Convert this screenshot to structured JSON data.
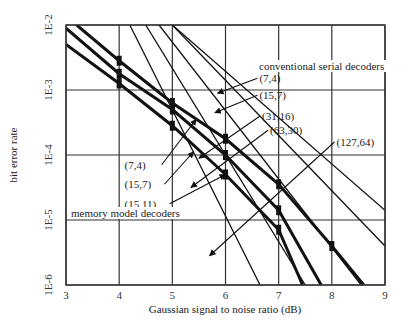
{
  "chart_data": {
    "type": "line",
    "title": "",
    "xlabel": "Gaussian signal to noise ratio (dB)",
    "ylabel": "bit error rate",
    "xlim": [
      3,
      9
    ],
    "ylim_log10": [
      -6,
      -2
    ],
    "y_scale": "log",
    "grid": true,
    "x_ticks": [
      "3",
      "4",
      "5",
      "6",
      "7",
      "8",
      "9"
    ],
    "y_ticks": [
      "1E-2",
      "1E-3",
      "1E-4",
      "1E-5",
      "1E-6"
    ],
    "group_labels": {
      "conventional": "conventional serial decoders",
      "memory": "memory model decoders"
    },
    "series": [
      {
        "name": "(7,4) conventional",
        "group": "conventional",
        "style": "thin",
        "points": [
          [
            4.2,
            -2.0
          ],
          [
            6.65,
            -6.0
          ]
        ]
      },
      {
        "name": "(15,7) conventional",
        "group": "conventional",
        "style": "thin",
        "points": [
          [
            4.5,
            -2.0
          ],
          [
            7.5,
            -6.0
          ]
        ]
      },
      {
        "name": "(31,16) conventional",
        "group": "conventional",
        "style": "thin",
        "points": [
          [
            4.75,
            -2.0
          ],
          [
            8.55,
            -6.0
          ]
        ]
      },
      {
        "name": "(63,30) conventional",
        "group": "conventional",
        "style": "thin",
        "points": [
          [
            5.0,
            -2.0
          ],
          [
            9.0,
            -5.4
          ]
        ]
      },
      {
        "name": "(127,64) conventional",
        "group": "conventional",
        "style": "thin",
        "points": [
          [
            5.0,
            -2.0
          ],
          [
            9.0,
            -4.85
          ]
        ]
      },
      {
        "name": "(7,4) memory",
        "group": "memory",
        "style": "thick",
        "points": [
          [
            3.0,
            -2.3
          ],
          [
            4.0,
            -2.9
          ],
          [
            5.0,
            -3.55
          ],
          [
            6.0,
            -4.3
          ],
          [
            7.0,
            -5.15
          ],
          [
            7.45,
            -6.0
          ]
        ]
      },
      {
        "name": "(15,7) memory",
        "group": "memory",
        "style": "thick",
        "points": [
          [
            3.0,
            -2.05
          ],
          [
            4.0,
            -2.75
          ],
          [
            5.0,
            -3.3
          ],
          [
            6.0,
            -4.0
          ],
          [
            7.0,
            -4.85
          ],
          [
            7.8,
            -6.0
          ]
        ]
      },
      {
        "name": "(15,11) memory",
        "group": "memory",
        "style": "thick",
        "points": [
          [
            3.2,
            -2.0
          ],
          [
            4.0,
            -2.55
          ],
          [
            5.0,
            -3.2
          ],
          [
            6.0,
            -3.75
          ],
          [
            7.0,
            -4.45
          ],
          [
            8.0,
            -5.4
          ],
          [
            8.6,
            -6.0
          ]
        ]
      }
    ],
    "annotations": [
      {
        "text": "(7,4)",
        "side": "right",
        "label_x": 6.6,
        "label_y": -2.82
      },
      {
        "text": "(15,7)",
        "side": "right",
        "label_x": 6.6,
        "label_y": -3.08
      },
      {
        "text": "(31,16)",
        "side": "right",
        "label_x": 6.65,
        "label_y": -3.4
      },
      {
        "text": "(63,30)",
        "side": "right",
        "label_x": 6.8,
        "label_y": -3.62
      },
      {
        "text": "(127,64)",
        "side": "right",
        "label_x": 8.05,
        "label_y": -3.8
      },
      {
        "text": "(7,4)",
        "side": "left",
        "label_x": 4.1,
        "label_y": -4.15
      },
      {
        "text": "(15,7)",
        "side": "left",
        "label_x": 4.1,
        "label_y": -4.45
      },
      {
        "text": "(15,11)",
        "side": "left",
        "label_x": 4.1,
        "label_y": -4.75
      }
    ]
  }
}
